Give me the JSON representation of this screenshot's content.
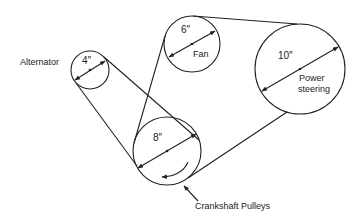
{
  "colors": {
    "stroke": "#222222",
    "background": "#ffffff"
  },
  "pulleys": [
    {
      "id": "alternator",
      "name": "Alternator",
      "diameter": "4″",
      "cx": 90,
      "cy": 70,
      "r": 19
    },
    {
      "id": "fan",
      "name": "Fan",
      "diameter": "6″",
      "cx": 192,
      "cy": 44,
      "r": 28
    },
    {
      "id": "power_steering",
      "name_line1": "Power",
      "name_line2": "steering",
      "diameter": "10″",
      "cx": 300,
      "cy": 69,
      "r": 45
    },
    {
      "id": "crankshaft",
      "name": "Crankshaft Pulleys",
      "diameter": "8″",
      "cx": 167,
      "cy": 151,
      "r": 34
    }
  ],
  "labels": {
    "alternator": "Alternator",
    "alternator_dia": "4″",
    "fan": "Fan",
    "fan_dia": "6″",
    "ps_line1": "Power",
    "ps_line2": "steering",
    "ps_dia": "10″",
    "crank": "Crankshaft Pulleys",
    "crank_dia": "8″"
  }
}
